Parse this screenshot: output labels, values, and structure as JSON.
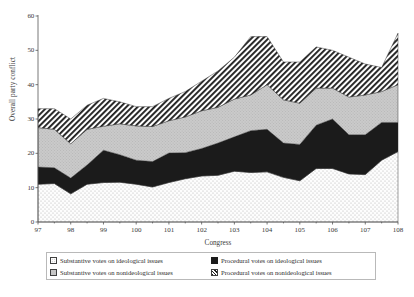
{
  "chart_data": {
    "type": "area",
    "stacked": true,
    "title": "",
    "xlabel": "Congress",
    "ylabel": "Overall party conflict",
    "xlim": [
      97,
      108
    ],
    "ylim": [
      0,
      60
    ],
    "xticks": [
      "97",
      "98",
      "99",
      "100",
      "101",
      "102",
      "103",
      "104",
      "105",
      "106",
      "107",
      "108"
    ],
    "yticks": [
      "0",
      "10",
      "20",
      "30",
      "40",
      "50",
      "60"
    ],
    "grid": false,
    "legend_position": "below-plot",
    "x": [
      97,
      97.5,
      98,
      98.5,
      99,
      99.5,
      100,
      100.5,
      101,
      101.5,
      102,
      102.5,
      103,
      103.5,
      104,
      104.5,
      105,
      105.5,
      106,
      106.5,
      107,
      107.5,
      108
    ],
    "series": [
      {
        "name": "Substantive votes on ideological issues",
        "pattern": "light-dotted",
        "values": [
          11.0,
          11.2,
          8.2,
          11.0,
          11.5,
          11.6,
          11.0,
          10.2,
          11.5,
          12.6,
          13.4,
          13.6,
          14.8,
          14.4,
          14.6,
          13.0,
          12.0,
          15.6,
          15.6,
          14.0,
          13.8,
          18.0,
          20.5
        ]
      },
      {
        "name": "Procedural votes on ideological issues",
        "pattern": "solid-black",
        "values": [
          5.0,
          4.6,
          4.6,
          5.6,
          9.4,
          8.0,
          7.0,
          7.4,
          8.6,
          7.6,
          8.0,
          9.4,
          10.0,
          12.2,
          12.4,
          10.0,
          10.6,
          12.6,
          14.4,
          11.4,
          11.6,
          11.0,
          8.5
        ]
      },
      {
        "name": "Substantive votes on nonideological issues",
        "pattern": "grey-stipple",
        "values": [
          11.5,
          11.2,
          10.0,
          10.4,
          7.0,
          9.0,
          10.0,
          10.2,
          9.4,
          10.4,
          11.0,
          10.4,
          11.0,
          10.4,
          13.0,
          12.6,
          12.0,
          10.8,
          9.0,
          11.0,
          11.6,
          9.0,
          11.0
        ]
      },
      {
        "name": "Procedural votes on nonideological issues",
        "pattern": "diagonal-hatch",
        "values": [
          5.5,
          6.0,
          7.2,
          7.0,
          8.1,
          6.4,
          5.6,
          5.8,
          6.5,
          7.4,
          8.6,
          10.6,
          12.2,
          17.0,
          14.0,
          11.0,
          12.0,
          12.0,
          11.0,
          11.6,
          9.0,
          7.0,
          15.0
        ]
      }
    ]
  },
  "axes": {
    "y_title": "Overall party conflict",
    "x_title": "Congress"
  },
  "legend": {
    "items": [
      {
        "label": "Substantive votes on ideological issues",
        "swatch": "light-dotted"
      },
      {
        "label": "Procedural votes on ideological issues",
        "swatch": "solid-black"
      },
      {
        "label": "Substantive votes on nonideological issues",
        "swatch": "grey-stipple"
      },
      {
        "label": "Procedural votes on nonideological issues",
        "swatch": "diagonal-hatch"
      }
    ]
  },
  "colors": {
    "band_substantive_ideological": "#fafafa",
    "band_procedural_ideological": "#1b1b1b",
    "band_substantive_nonideological": "#c6c6c6",
    "band_procedural_nonideological": "#ffffff",
    "axis": "#4a4a4a",
    "text": "#2b2b2b"
  }
}
